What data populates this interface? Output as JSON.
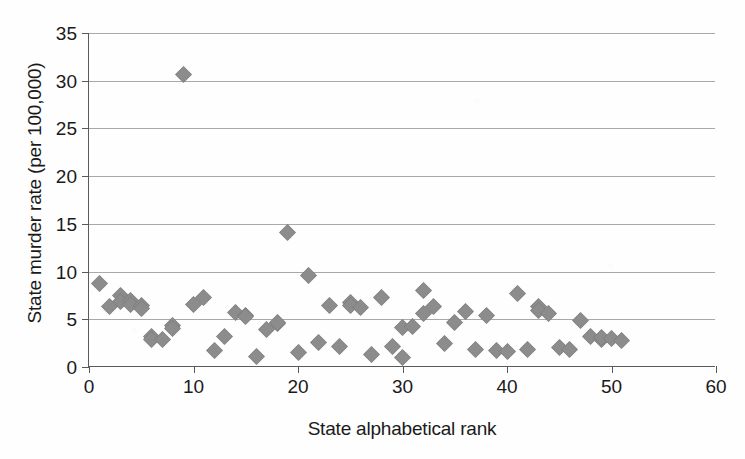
{
  "chart_data": {
    "type": "scatter",
    "title": "",
    "xlabel": "State alphabetical rank",
    "ylabel": "State murder rate (per 100,000)",
    "xlim": [
      0,
      60
    ],
    "ylim": [
      0,
      35
    ],
    "xticks": [
      0,
      10,
      20,
      30,
      40,
      50,
      60
    ],
    "yticks": [
      0,
      5,
      10,
      15,
      20,
      25,
      30,
      35
    ],
    "grid": "horizontal",
    "legend": "none",
    "marker": "diamond",
    "marker_color": "#8c8c8c",
    "series": [
      {
        "name": "State murder rate",
        "points": [
          [
            1,
            8.8
          ],
          [
            2,
            6.3
          ],
          [
            3,
            7.5
          ],
          [
            3,
            6.9
          ],
          [
            4,
            7.0
          ],
          [
            4,
            6.6
          ],
          [
            5,
            6.4
          ],
          [
            5,
            6.1
          ],
          [
            6,
            3.2
          ],
          [
            6,
            2.9
          ],
          [
            7,
            2.9
          ],
          [
            8,
            4.4
          ],
          [
            8,
            4.0
          ],
          [
            9,
            30.7
          ],
          [
            10,
            6.6
          ],
          [
            11,
            7.3
          ],
          [
            12,
            1.7
          ],
          [
            13,
            3.2
          ],
          [
            14,
            5.7
          ],
          [
            15,
            5.4
          ],
          [
            15,
            5.3
          ],
          [
            16,
            1.1
          ],
          [
            17,
            3.9
          ],
          [
            18,
            4.6
          ],
          [
            18,
            4.7
          ],
          [
            19,
            14.1
          ],
          [
            20,
            1.5
          ],
          [
            21,
            9.6
          ],
          [
            22,
            2.6
          ],
          [
            23,
            6.4
          ],
          [
            24,
            2.1
          ],
          [
            25,
            6.8
          ],
          [
            25,
            6.4
          ],
          [
            26,
            6.2
          ],
          [
            27,
            1.3
          ],
          [
            28,
            7.3
          ],
          [
            29,
            2.1
          ],
          [
            30,
            4.1
          ],
          [
            30,
            1.0
          ],
          [
            31,
            4.2
          ],
          [
            32,
            8.0
          ],
          [
            32,
            5.6
          ],
          [
            33,
            6.3
          ],
          [
            34,
            2.5
          ],
          [
            35,
            4.7
          ],
          [
            36,
            5.8
          ],
          [
            37,
            1.8
          ],
          [
            38,
            5.4
          ],
          [
            39,
            1.7
          ],
          [
            40,
            1.6
          ],
          [
            41,
            7.7
          ],
          [
            42,
            1.8
          ],
          [
            43,
            6.3
          ],
          [
            43,
            5.9
          ],
          [
            44,
            5.6
          ],
          [
            45,
            2.0
          ],
          [
            46,
            1.8
          ],
          [
            47,
            4.9
          ],
          [
            48,
            3.2
          ],
          [
            49,
            2.9
          ],
          [
            49,
            3.1
          ],
          [
            50,
            3.0
          ],
          [
            51,
            2.8
          ]
        ]
      }
    ]
  }
}
